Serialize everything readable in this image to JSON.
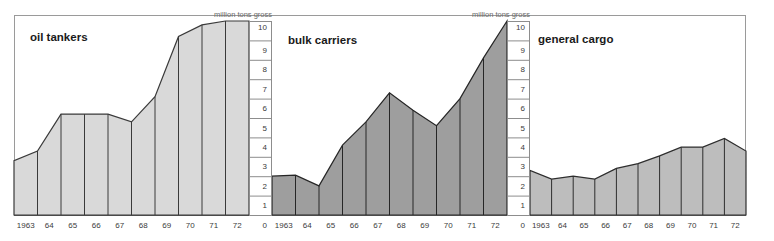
{
  "figure": {
    "background_color": "#ffffff",
    "frame_color": "#9a9a9a",
    "axis_caption": "million tons gross",
    "scale_ticks": [
      "10",
      "9",
      "8",
      "7",
      "6",
      "5",
      "4",
      "3",
      "2",
      "1",
      "0"
    ],
    "years": [
      "1963",
      "64",
      "65",
      "66",
      "67",
      "68",
      "69",
      "70",
      "71",
      "72"
    ]
  },
  "chart_data": [
    {
      "type": "area",
      "title": "oil tankers",
      "panel": 1,
      "xlabel": "",
      "ylabel": "million tons gross",
      "ylim": [
        0,
        10
      ],
      "grid": false,
      "legend": "none",
      "fill_color": "#d9d9d9",
      "line_color": "#3a3a3a",
      "categories": [
        "1963",
        "64",
        "65",
        "66",
        "67",
        "68",
        "69",
        "70",
        "71",
        "72"
      ],
      "edge_start_value": 2.8,
      "values": [
        3.3,
        5.2,
        5.2,
        5.2,
        4.8,
        6.1,
        9.2,
        9.8,
        10.0,
        10.0
      ],
      "tick_labels": [
        "10",
        "9",
        "8",
        "7",
        "6",
        "5",
        "4",
        "3",
        "2",
        "1",
        "0"
      ]
    },
    {
      "type": "area",
      "title": "bulk carriers",
      "panel": 2,
      "xlabel": "",
      "ylabel": "million tons gross",
      "ylim": [
        0,
        10
      ],
      "grid": false,
      "legend": "none",
      "fill_color": "#9e9e9e",
      "line_color": "#262626",
      "categories": [
        "1963",
        "64",
        "65",
        "66",
        "67",
        "68",
        "69",
        "70",
        "71",
        "72"
      ],
      "edge_start_value": 2.0,
      "values": [
        2.05,
        1.5,
        3.6,
        4.8,
        6.3,
        5.4,
        4.6,
        6.0,
        8.1,
        10.0
      ],
      "tick_labels": [
        "10",
        "9",
        "8",
        "7",
        "6",
        "5",
        "4",
        "3",
        "2",
        "1",
        "0"
      ]
    },
    {
      "type": "area",
      "title": "general cargo",
      "panel": 3,
      "xlabel": "",
      "ylabel": "million tons gross",
      "ylim": [
        0,
        10
      ],
      "grid": false,
      "legend": "none",
      "fill_color": "#bdbdbd",
      "line_color": "#2e2e2e",
      "categories": [
        "1963",
        "64",
        "65",
        "66",
        "67",
        "68",
        "69",
        "70",
        "71",
        "72"
      ],
      "edge_start_value": 2.3,
      "values": [
        1.85,
        2.0,
        1.85,
        2.4,
        2.65,
        3.05,
        3.5,
        3.5,
        3.95,
        3.3
      ],
      "tick_labels": [
        "10",
        "9",
        "8",
        "7",
        "6",
        "5",
        "4",
        "3",
        "2",
        "1",
        "0"
      ]
    }
  ]
}
